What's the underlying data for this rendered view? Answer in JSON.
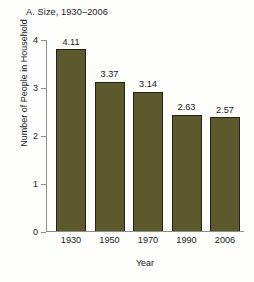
{
  "chart_data": {
    "type": "bar",
    "title": "A. Size, 1930–2006",
    "xlabel": "Year",
    "ylabel": "Number of People in Household",
    "categories": [
      "1930",
      "1950",
      "1970",
      "1990",
      "2006"
    ],
    "values": [
      4.11,
      3.37,
      3.14,
      2.63,
      2.57
    ],
    "value_labels": [
      "4.11",
      "3.37",
      "3.14",
      "2.63",
      "2.57"
    ],
    "ylim": [
      0,
      4.35
    ],
    "yticks": [
      0,
      1,
      2,
      3,
      4
    ],
    "ytick_labels": [
      "0",
      "1",
      "2",
      "3",
      "4"
    ],
    "grid": false,
    "legend": false,
    "series": [
      {
        "name": "Average household size",
        "values": [
          4.11,
          3.37,
          3.14,
          2.63,
          2.57
        ]
      }
    ],
    "colors": {
      "bar_fill": "#5c5a2c",
      "bar_edge": "#22211a",
      "axis": "#8d8d87",
      "text": "#1c1c1c",
      "background": "#fdfdfb"
    }
  }
}
